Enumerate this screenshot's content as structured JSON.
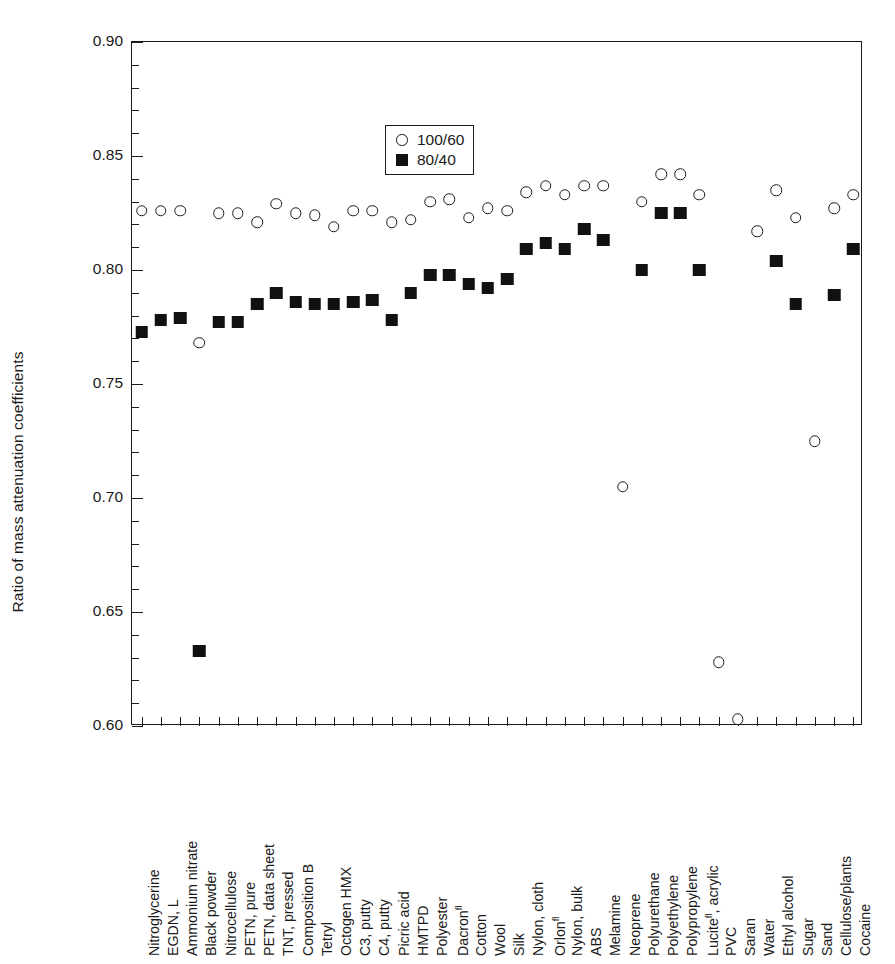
{
  "chart_data": {
    "type": "scatter",
    "title": "",
    "xlabel": "",
    "ylabel": "Ratio of mass attenuation coefficients",
    "ylim": [
      0.6,
      0.9
    ],
    "ytick_labels": [
      "0.90",
      "0.85",
      "0.80",
      "0.75",
      "0.70",
      "0.65",
      "0.60"
    ],
    "ytick_values": [
      0.9,
      0.85,
      0.8,
      0.75,
      0.7,
      0.65,
      0.6
    ],
    "yminor_step": 0.01,
    "grid": false,
    "legend_position": "top-left-inside",
    "legend": [
      "100/60",
      "80/40"
    ],
    "categories": [
      "Nitroglycerine",
      "EGDN, L",
      "Ammonium nitrate",
      "Black powder",
      "Nitrocellulose",
      "PETN, pure",
      "PETN, data sheet",
      "TNT, pressed",
      "Composition B",
      "Tetryl",
      "Octogen HMX",
      "C3, putty",
      "C4, putty",
      "Picric acid",
      "HMTPD",
      "Polyester",
      "Dacron",
      "Cotton",
      "Wool",
      "Silk",
      "Nylon, cloth",
      "Orlon",
      "Nylon, bulk",
      "ABS",
      "Melamine",
      "Neoprene",
      "Polyurethane",
      "Polyethylene",
      "Polypropylene",
      "Lucite, acrylic",
      "PVC",
      "Saran",
      "Water",
      "Ethyl alcohol",
      "Sugar",
      "Sand",
      "Cellulose/plants",
      "Cocaine"
    ],
    "category_superscripts": {
      "Dacron": "fl",
      "Orlon": "fl",
      "Lucite, acrylic": "fl"
    },
    "series": [
      {
        "name": "100/60",
        "marker": "open-circle",
        "values": [
          0.826,
          0.826,
          0.826,
          0.768,
          0.825,
          0.825,
          0.821,
          0.829,
          0.825,
          0.824,
          0.819,
          0.826,
          0.826,
          0.821,
          0.822,
          0.83,
          0.831,
          0.823,
          0.827,
          0.826,
          0.834,
          0.837,
          0.833,
          0.837,
          0.837,
          0.705,
          0.83,
          0.842,
          0.842,
          0.833,
          0.628,
          0.603,
          0.817,
          0.835,
          0.823,
          0.725,
          0.827,
          0.833
        ]
      },
      {
        "name": "80/40",
        "marker": "filled-square",
        "values": [
          0.773,
          0.778,
          0.779,
          0.633,
          0.777,
          0.777,
          0.785,
          0.79,
          0.786,
          0.785,
          0.785,
          0.786,
          0.787,
          0.778,
          0.79,
          0.798,
          0.798,
          0.794,
          0.792,
          0.796,
          0.809,
          0.812,
          0.809,
          0.818,
          0.813,
          null,
          0.8,
          0.825,
          0.825,
          0.8,
          null,
          null,
          null,
          0.804,
          0.785,
          null,
          0.789,
          0.809
        ]
      }
    ]
  },
  "legend": {
    "items": [
      {
        "label": "100/60",
        "marker": "open-circle"
      },
      {
        "label": "80/40",
        "marker": "filled-square"
      }
    ]
  },
  "axis": {
    "y_title": "Ratio of mass attenuation coefficients"
  }
}
